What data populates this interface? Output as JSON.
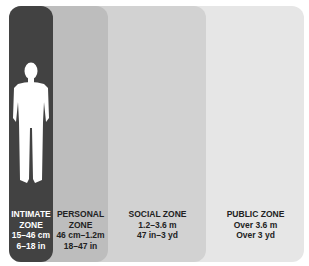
{
  "diagram": {
    "zones": [
      {
        "id": "intimate",
        "lines": [
          "INTIMATE",
          "ZONE",
          "15–46 cm",
          "6–18 in"
        ],
        "color": "#424242"
      },
      {
        "id": "personal",
        "lines": [
          "PERSONAL",
          "ZONE",
          "46 cm–1.2m",
          "18–47 in"
        ],
        "color": "#bdbdbd"
      },
      {
        "id": "social",
        "lines": [
          "SOCIAL ZONE",
          "1.2–3.6 m",
          "47 in–3 yd"
        ],
        "color": "#d2d2d2"
      },
      {
        "id": "public",
        "lines": [
          "PUBLIC ZONE",
          "Over 3.6 m",
          "Over 3 yd"
        ],
        "color": "#e6e6e6"
      }
    ],
    "figure": "person-silhouette-icon"
  }
}
